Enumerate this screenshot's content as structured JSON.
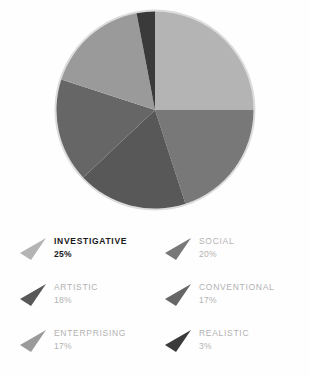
{
  "chart_data": {
    "type": "pie",
    "title": "",
    "legend_position": "bottom",
    "start_angle": 0,
    "direction": "clockwise",
    "categories": [
      "INVESTIGATIVE",
      "SOCIAL",
      "ARTISTIC",
      "CONVENTIONAL",
      "ENTERPRISING",
      "REALISTIC"
    ],
    "values": [
      25,
      20,
      18,
      17,
      17,
      3
    ],
    "value_labels": [
      "25%",
      "20%",
      "18%",
      "17%",
      "17%",
      "3%"
    ],
    "unit": "%",
    "colors": [
      "#b4b4b4",
      "#787878",
      "#585858",
      "#666666",
      "#9a9a9a",
      "#3a3a3a"
    ],
    "slices": [
      {
        "label": "INVESTIGATIVE",
        "value": 25,
        "value_label": "25%",
        "color": "#b4b4b4",
        "highlighted": true
      },
      {
        "label": "SOCIAL",
        "value": 20,
        "value_label": "20%",
        "color": "#787878",
        "highlighted": false
      },
      {
        "label": "ARTISTIC",
        "value": 18,
        "value_label": "18%",
        "color": "#585858",
        "highlighted": false
      },
      {
        "label": "CONVENTIONAL",
        "value": 17,
        "value_label": "17%",
        "color": "#666666",
        "highlighted": false
      },
      {
        "label": "ENTERPRISING",
        "value": 17,
        "value_label": "17%",
        "color": "#9a9a9a",
        "highlighted": false
      },
      {
        "label": "REALISTIC",
        "value": 3,
        "value_label": "3%",
        "color": "#3a3a3a",
        "highlighted": false
      }
    ]
  },
  "legend": {
    "left_column": [
      {
        "label": "INVESTIGATIVE",
        "value_label": "25%",
        "color": "#b4b4b4"
      },
      {
        "label": "ARTISTIC",
        "value_label": "18%",
        "color": "#585858"
      },
      {
        "label": "ENTERPRISING",
        "value_label": "17%",
        "color": "#9a9a9a"
      }
    ],
    "right_column": [
      {
        "label": "SOCIAL",
        "value_label": "20%",
        "color": "#787878"
      },
      {
        "label": "CONVENTIONAL",
        "value_label": "17%",
        "color": "#666666"
      },
      {
        "label": "REALISTIC",
        "value_label": "3%",
        "color": "#3a3a3a"
      }
    ]
  },
  "colors": {
    "background": "#fefefe",
    "legend_text": "#b2b2b2",
    "legend_text_highlight": "#1a1a1a",
    "pie_ring": "#d8d8d8"
  }
}
